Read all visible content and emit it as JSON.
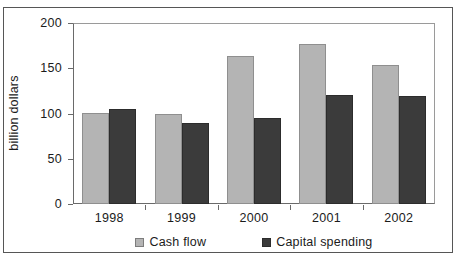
{
  "chart_data": {
    "type": "bar",
    "title": "",
    "xlabel": "",
    "ylabel": "billion dollars",
    "categories": [
      "1998",
      "1999",
      "2000",
      "2001",
      "2002"
    ],
    "series": [
      {
        "name": "Cash flow",
        "color": "#b4b4b4",
        "values": [
          101,
          100,
          164,
          177,
          154
        ]
      },
      {
        "name": "Capital spending",
        "color": "#3b3b3b",
        "values": [
          105,
          90,
          95,
          120,
          119
        ]
      }
    ],
    "ylim": [
      0,
      200
    ],
    "yticks": [
      0,
      50,
      100,
      150,
      200
    ],
    "ytick_labels": [
      "0",
      "50",
      "100",
      "150",
      "200"
    ],
    "grid": false,
    "legend_position": "bottom",
    "frame": true
  },
  "legend": {
    "items": [
      {
        "label": "Cash flow",
        "swatch": "cash"
      },
      {
        "label": "Capital spending",
        "swatch": "capital"
      }
    ]
  },
  "top_cut_text": ""
}
